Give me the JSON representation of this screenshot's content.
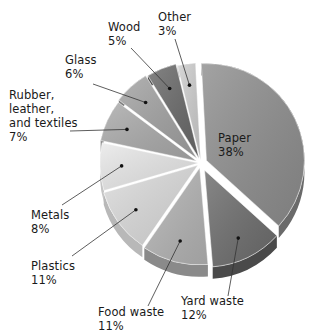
{
  "chart_data": {
    "type": "pie",
    "title": "",
    "style": "3d-exploded",
    "start_angle_deg": -3,
    "direction": "clockwise",
    "slices": [
      {
        "label": "Paper",
        "value": 38,
        "color": "#8f8f8f",
        "side": "#6a6a6a"
      },
      {
        "label": "Yard waste",
        "value": 12,
        "color": "#6e6e6e",
        "side": "#4a4a4a"
      },
      {
        "label": "Food waste",
        "value": 11,
        "color": "#b5b5b5",
        "side": "#8a8a8a"
      },
      {
        "label": "Plastics",
        "value": 11,
        "color": "#dcdcdc",
        "side": "#b8b8b8"
      },
      {
        "label": "Metals",
        "value": 8,
        "color": "#e9e9e9",
        "side": "#c4c4c4"
      },
      {
        "label": "Rubber, leather, and textiles",
        "value": 7,
        "color": "#ababab",
        "side": "#888888"
      },
      {
        "label": "Glass",
        "value": 6,
        "color": "#a3a3a3",
        "side": "#7e7e7e"
      },
      {
        "label": "Wood",
        "value": 5,
        "color": "#6a6a6a",
        "side": "#4c4c4c"
      },
      {
        "label": "Other",
        "value": 3,
        "color": "#cfcfcf",
        "side": "#a8a8a8"
      }
    ]
  },
  "labels": {
    "paper": {
      "name": "Paper",
      "pct": "38%"
    },
    "yard": {
      "name": "Yard waste",
      "pct": "12%"
    },
    "food": {
      "name": "Food waste",
      "pct": "11%"
    },
    "plastics": {
      "name": "Plastics",
      "pct": "11%"
    },
    "metals": {
      "name": "Metals",
      "pct": "8%"
    },
    "rubber": {
      "line1": "Rubber,",
      "line2": "leather,",
      "line3": "and textiles",
      "pct": "7%"
    },
    "glass": {
      "name": "Glass",
      "pct": "6%"
    },
    "wood": {
      "name": "Wood",
      "pct": "5%"
    },
    "other": {
      "name": "Other",
      "pct": "3%"
    }
  }
}
